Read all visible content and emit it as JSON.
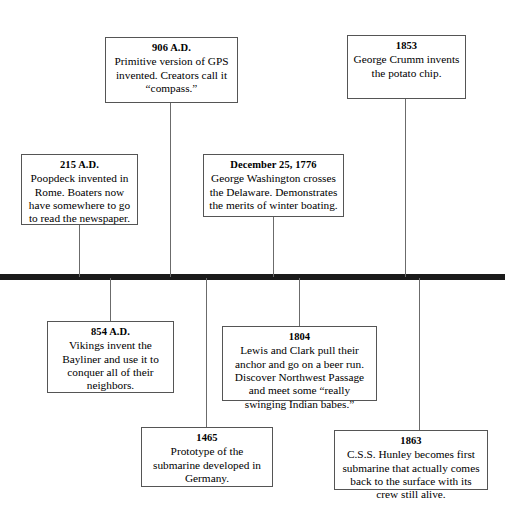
{
  "diagram": {
    "type": "horizontal-timeline",
    "axis": {
      "label": "timeline-axis",
      "color": "#1a1a1a"
    },
    "events": [
      {
        "id": "906",
        "date": "906 A.D.",
        "text": "Primitive version of GPS invented.  Creators call it “compass.”",
        "side": "above"
      },
      {
        "id": "1853",
        "date": "1853",
        "text": "George Crumm invents the potato chip.",
        "side": "above"
      },
      {
        "id": "215",
        "date": "215 A.D.",
        "text": "Poopdeck invented in Rome.  Boaters now have somewhere to go to read the newspaper.",
        "side": "above"
      },
      {
        "id": "1776",
        "date": "December 25, 1776",
        "text": "George Washington crosses the Delaware.  Demonstrates the merits of winter boating.",
        "side": "above"
      },
      {
        "id": "854",
        "date": "854 A.D.",
        "text": "Vikings invent the Bayliner and use it to conquer all of their neighbors.",
        "side": "below"
      },
      {
        "id": "1804",
        "date": "1804",
        "text": "Lewis and Clark pull their anchor and go on a beer run.  Discover Northwest Passage and meet some “really swinging Indian babes.”",
        "side": "below"
      },
      {
        "id": "1465",
        "date": "1465",
        "text": "Prototype of the submarine developed in Germany.",
        "side": "below"
      },
      {
        "id": "1863",
        "date": "1863",
        "text": "C.S.S. Hunley becomes first submarine that actually comes back to the surface with its crew still alive.",
        "side": "below"
      }
    ]
  }
}
